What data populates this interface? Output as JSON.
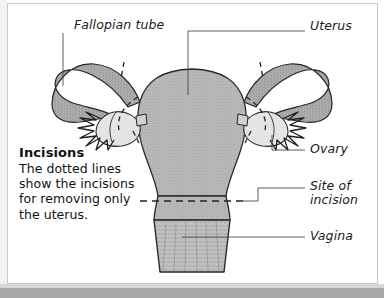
{
  "figure": {
    "kind": "anatomical-diagram",
    "background_color": "#ffffff",
    "ink_color": "#1b1b1b",
    "organ_fill_color": "#b7b7b7",
    "organ_light_fill_color": "#e2e2e2",
    "leader_line_color": "#555555"
  },
  "labels": {
    "fallopian_tube": "Fallopian tube",
    "uterus": "Uterus",
    "ovary": "Ovary",
    "site_of_incision": "Site of\nincision",
    "site_of_incision_line1": "Site of",
    "site_of_incision_line2": "incision",
    "vagina": "Vagina"
  },
  "note": {
    "title": "Incisions",
    "body": "The dotted lines show the incisions for removing only the uterus."
  }
}
